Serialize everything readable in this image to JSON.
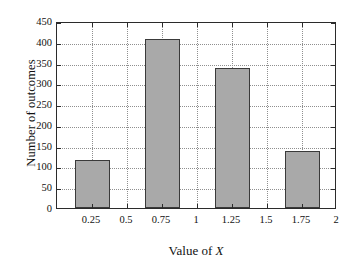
{
  "chart_data": {
    "type": "bar",
    "title": "",
    "subtitle": "",
    "xlabel": "Value of X",
    "xlabel_plain": "Value of ",
    "xlabel_var": "X",
    "ylabel": "Number of outcomes",
    "categories": [
      "0.25",
      "0.75",
      "1.25",
      "1.75"
    ],
    "x": [
      0.25,
      0.75,
      1.25,
      1.75
    ],
    "values": [
      116,
      406,
      338,
      137
    ],
    "bar_width": 0.25,
    "xlim": [
      0,
      2
    ],
    "ylim": [
      0,
      450
    ],
    "xticks": [
      0.25,
      0.5,
      0.75,
      1,
      1.25,
      1.5,
      1.75,
      2
    ],
    "xticklabels": [
      "0.25",
      "0.5",
      "0.75",
      "1",
      "1.25",
      "1.5",
      "1.75",
      "2"
    ],
    "yticks": [
      0,
      50,
      100,
      150,
      200,
      250,
      300,
      350,
      400,
      450
    ],
    "yticklabels": [
      "0",
      "50",
      "100",
      "150",
      "200",
      "250",
      "300",
      "350",
      "400",
      "450"
    ],
    "grid": true,
    "grid_style": "dotted",
    "legend": null,
    "legend_position": "none",
    "annotations": [],
    "series": [
      {
        "name": "outcomes",
        "values": [
          116,
          406,
          338,
          137
        ]
      }
    ]
  },
  "style": {
    "bar_fill": "#a9a9a9",
    "bar_edge": "#3a3a3a",
    "axis_color": "#2b2b2b",
    "grid_color": "#8f8f8f",
    "background": "#ffffff",
    "text_color": "#111111"
  }
}
